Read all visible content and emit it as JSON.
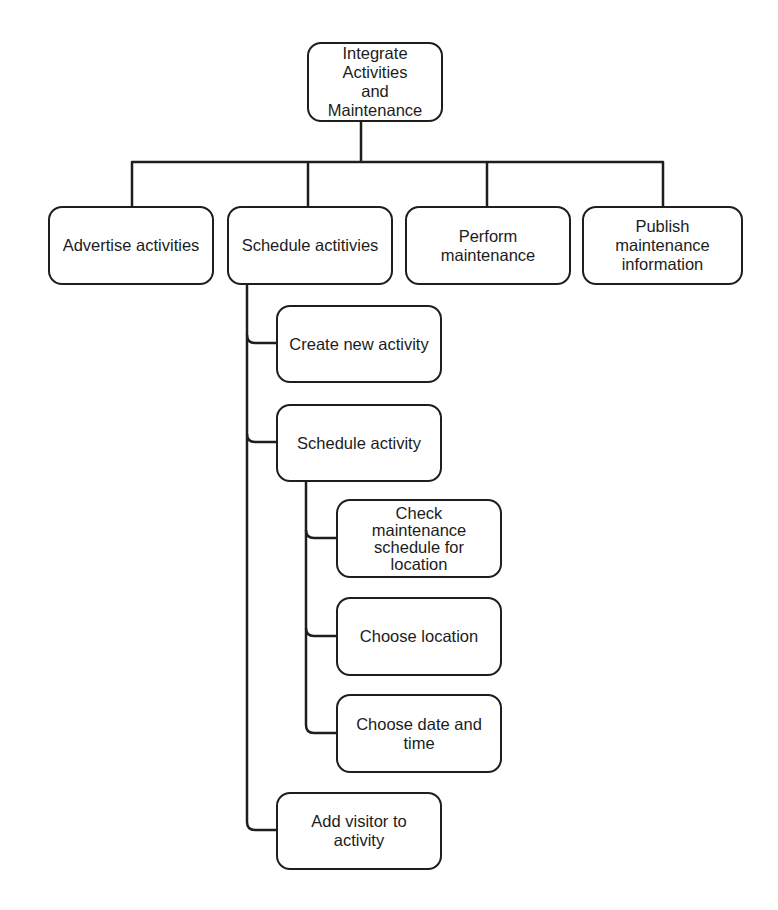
{
  "diagram": {
    "type": "hierarchy-tree",
    "root": {
      "id": "root",
      "label": "Integrate Activities\nand Maintenance"
    },
    "level1": [
      {
        "id": "advertise",
        "label": "Advertise activities"
      },
      {
        "id": "schedule",
        "label": "Schedule actitivies"
      },
      {
        "id": "perform",
        "label": "Perform\nmaintenance"
      },
      {
        "id": "publish",
        "label": "Publish\nmaintenance\ninformation"
      }
    ],
    "schedule_children": [
      {
        "id": "create",
        "label": "Create new activity"
      },
      {
        "id": "schedule_activity",
        "label": "Schedule activity"
      },
      {
        "id": "add_visitor",
        "label": "Add visitor to\nactivity"
      }
    ],
    "schedule_activity_children": [
      {
        "id": "check",
        "label": "Check\nmaintenance\nschedule for\nlocation"
      },
      {
        "id": "choose_location",
        "label": "Choose location"
      },
      {
        "id": "choose_datetime",
        "label": "Choose date and\ntime"
      }
    ],
    "colors": {
      "line": "#1e1e1e",
      "background": "#ffffff",
      "text": "#1c1c1c"
    }
  }
}
